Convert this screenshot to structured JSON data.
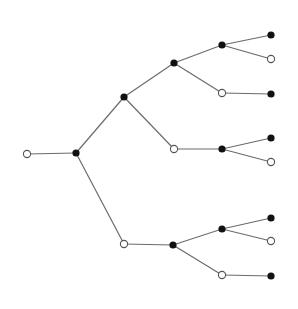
{
  "diagram": {
    "type": "tree",
    "colors": {
      "edge": "#6b6b6b",
      "filled": "#111111",
      "open_fill": "#ffffff",
      "open_stroke": "#555555"
    },
    "node_radius": 3.6,
    "nodes": [
      {
        "id": "n0",
        "x": 27,
        "y": 154,
        "kind": "open"
      },
      {
        "id": "n1",
        "x": 76,
        "y": 153,
        "kind": "filled"
      },
      {
        "id": "n2",
        "x": 124,
        "y": 97,
        "kind": "filled"
      },
      {
        "id": "n3",
        "x": 124,
        "y": 244,
        "kind": "open"
      },
      {
        "id": "n4",
        "x": 174,
        "y": 63,
        "kind": "filled"
      },
      {
        "id": "n5",
        "x": 174,
        "y": 149,
        "kind": "open"
      },
      {
        "id": "n6",
        "x": 222,
        "y": 45,
        "kind": "filled"
      },
      {
        "id": "n7",
        "x": 222,
        "y": 93,
        "kind": "open"
      },
      {
        "id": "n8",
        "x": 271,
        "y": 35,
        "kind": "filled"
      },
      {
        "id": "n9",
        "x": 271,
        "y": 59,
        "kind": "open"
      },
      {
        "id": "n10",
        "x": 271,
        "y": 94,
        "kind": "filled"
      },
      {
        "id": "n11",
        "x": 222,
        "y": 149,
        "kind": "filled"
      },
      {
        "id": "n12",
        "x": 271,
        "y": 138,
        "kind": "filled"
      },
      {
        "id": "n13",
        "x": 271,
        "y": 162,
        "kind": "open"
      },
      {
        "id": "n14",
        "x": 173,
        "y": 245,
        "kind": "filled"
      },
      {
        "id": "n15",
        "x": 222,
        "y": 229,
        "kind": "filled"
      },
      {
        "id": "n16",
        "x": 222,
        "y": 275,
        "kind": "open"
      },
      {
        "id": "n17",
        "x": 271,
        "y": 218,
        "kind": "filled"
      },
      {
        "id": "n18",
        "x": 271,
        "y": 241,
        "kind": "open"
      },
      {
        "id": "n19",
        "x": 271,
        "y": 276,
        "kind": "filled"
      }
    ],
    "edges": [
      [
        "n0",
        "n1"
      ],
      [
        "n1",
        "n2"
      ],
      [
        "n1",
        "n3"
      ],
      [
        "n2",
        "n4"
      ],
      [
        "n2",
        "n5"
      ],
      [
        "n4",
        "n6"
      ],
      [
        "n4",
        "n7"
      ],
      [
        "n6",
        "n8"
      ],
      [
        "n6",
        "n9"
      ],
      [
        "n7",
        "n10"
      ],
      [
        "n5",
        "n11"
      ],
      [
        "n11",
        "n12"
      ],
      [
        "n11",
        "n13"
      ],
      [
        "n3",
        "n14"
      ],
      [
        "n14",
        "n15"
      ],
      [
        "n14",
        "n16"
      ],
      [
        "n15",
        "n17"
      ],
      [
        "n15",
        "n18"
      ],
      [
        "n16",
        "n19"
      ]
    ]
  }
}
